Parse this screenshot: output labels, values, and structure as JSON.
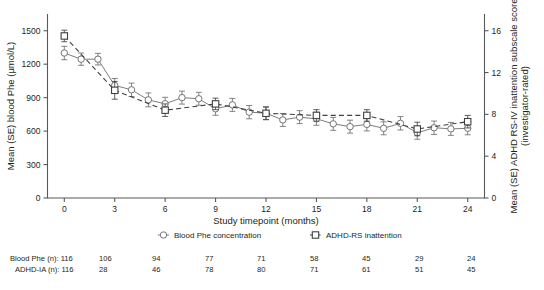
{
  "chart_data": {
    "type": "line",
    "title": "",
    "xlabel": "Study timepoint (months)",
    "ylabel_left": "Mean (SE) blood Phe (µmol/L)",
    "ylabel_right": "Mean (SE) ADHD RS-IV inattention subscale score (investigator-rated)",
    "xlim": [
      -1,
      25
    ],
    "ylim_left": [
      0,
      1650
    ],
    "ylim_right": [
      0,
      17.6
    ],
    "xticks": [
      0,
      3,
      6,
      9,
      12,
      15,
      18,
      21,
      24
    ],
    "xticklabels": [
      "0",
      "3",
      "6",
      "9",
      "12",
      "15",
      "18",
      "21",
      "24"
    ],
    "yticks_left": [
      0,
      300,
      600,
      900,
      1200,
      1500
    ],
    "yticklabels_left": [
      "0",
      "300",
      "600",
      "900",
      "1200",
      "1500"
    ],
    "yticks_right": [
      0,
      4,
      8,
      12,
      16
    ],
    "yticklabels_right": [
      "0",
      "4",
      "8",
      "12",
      "16"
    ],
    "grid": false,
    "legend_position": "below-axis",
    "series": [
      {
        "name": "Blood Phe concentration",
        "axis": "left",
        "marker": "circle",
        "linestyle": "solid",
        "color": "#6d6e71",
        "x": [
          0,
          1,
          2,
          3,
          4,
          5,
          6,
          7,
          8,
          9,
          10,
          11,
          12,
          13,
          14,
          15,
          16,
          17,
          18,
          19,
          20,
          21,
          22,
          23,
          24
        ],
        "values": [
          1300,
          1245,
          1245,
          1010,
          970,
          880,
          845,
          900,
          890,
          800,
          835,
          770,
          760,
          700,
          725,
          710,
          665,
          640,
          660,
          625,
          670,
          585,
          630,
          620,
          625
        ],
        "errors": [
          60,
          55,
          52,
          62,
          60,
          62,
          58,
          58,
          58,
          58,
          58,
          60,
          58,
          58,
          58,
          58,
          58,
          58,
          58,
          58,
          60,
          58,
          60,
          58,
          58
        ]
      },
      {
        "name": "ADHD-RS inattention",
        "axis": "right",
        "marker": "square",
        "linestyle": "dashed",
        "color": "#414042",
        "x": [
          0,
          3,
          6,
          9,
          12,
          15,
          18,
          21,
          24
        ],
        "values": [
          15.5,
          10.3,
          8.4,
          9.0,
          8.1,
          7.9,
          7.9,
          6.6,
          7.3
        ],
        "errors": [
          0.55,
          0.85,
          0.6,
          0.55,
          0.6,
          0.55,
          0.55,
          0.65,
          0.6
        ]
      }
    ],
    "counts_table": {
      "rows": [
        {
          "label": "Blood Phe (n): 116",
          "values": [
            "106",
            "94",
            "77",
            "71",
            "58",
            "45",
            "29",
            "24"
          ]
        },
        {
          "label": "ADHD-IA (n): 116",
          "values": [
            "28",
            "46",
            "78",
            "80",
            "71",
            "61",
            "51",
            "45"
          ]
        }
      ]
    }
  },
  "legend": {
    "items": [
      {
        "label": "Blood Phe concentration",
        "marker": "circle",
        "linestyle": "solid"
      },
      {
        "label": "ADHD-RS inattention",
        "marker": "square",
        "linestyle": "dashed"
      }
    ]
  },
  "colors": {
    "phe_series": "#6d6e71",
    "adhd_series": "#414042",
    "axis": "#58595b",
    "text": "#231f20",
    "background": "#ffffff"
  }
}
